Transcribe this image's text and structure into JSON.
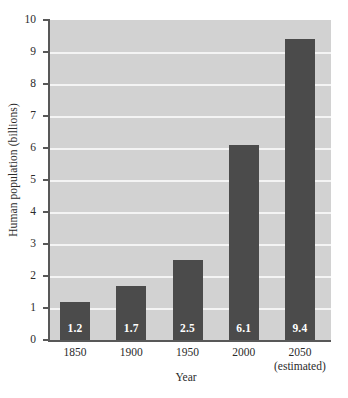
{
  "chart_data": {
    "type": "bar",
    "title": "",
    "subtitle": "",
    "xlabel": "Year",
    "ylabel": "Human population (billions)",
    "categories": [
      "1850",
      "1900",
      "1950",
      "2000",
      "2050"
    ],
    "category_sublabels": [
      "",
      "",
      "",
      "",
      "(estimated)"
    ],
    "values": [
      1.2,
      1.7,
      2.5,
      6.1,
      9.4
    ],
    "value_labels": [
      "1.2",
      "1.7",
      "2.5",
      "6.1",
      "9.4"
    ],
    "ylim": [
      0,
      10
    ],
    "ytick_labels": [
      "0",
      "1",
      "2",
      "3",
      "4",
      "5",
      "6",
      "7",
      "8",
      "9",
      "10"
    ],
    "ytick_values": [
      0,
      1,
      2,
      3,
      4,
      5,
      6,
      7,
      8,
      9,
      10
    ],
    "grid": "horizontal",
    "legend": "none",
    "colors": {
      "bar": "#4b4b4b",
      "plot_background": "#d2d2d2",
      "gridline": "#f4f4f4",
      "axis": "#585858",
      "text": "#2b2b2b",
      "value_label": "#ffffff",
      "figure_background": "#ffffff"
    }
  }
}
